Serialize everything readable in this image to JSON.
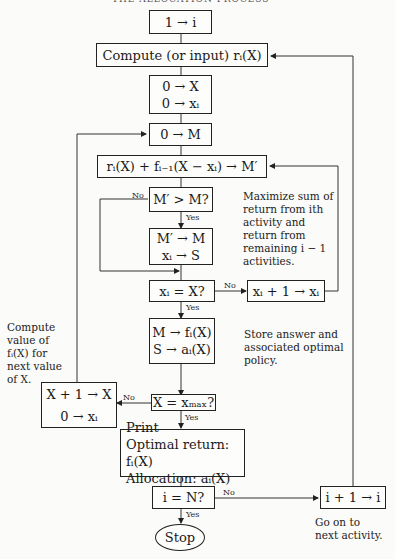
{
  "header": {
    "text": "THE ALLOCATION PROCESS"
  },
  "boxes": {
    "init_i": "1 → i",
    "compute_r": "Compute (or input) rᵢ(X)",
    "init_X": "0 → X",
    "init_xi": "0 → xᵢ",
    "init_M": "0 → M",
    "eval": "rᵢ(X) + fᵢ₋₁(X − xᵢ) → M′",
    "compare": "M′ > M?",
    "update_M": "M′ → M",
    "update_S": "xᵢ → S",
    "check_xi": "xᵢ = X?",
    "inc_xi": "xᵢ + 1 → xᵢ",
    "store_f": "M → fᵢ(X)",
    "store_a": "S → aᵢ(X)",
    "inc_X": "X + 1 → X",
    "reset_xi": "0 → xᵢ",
    "check_X": "X = xₘₐₓ?",
    "print_title": "Print",
    "print_return": "Optimal return: fᵢ(X)",
    "print_alloc": "Allocation: aᵢ(X)",
    "check_i": "i = N?",
    "inc_i": "i + 1 → i",
    "stop": "Stop"
  },
  "labels": {
    "yes": "Yes",
    "no": "No"
  },
  "notes": {
    "maximize": [
      "Maximize sum of",
      "return from ith",
      "activity and",
      "return from",
      "remaining i − 1",
      "activities."
    ],
    "store": [
      "Store answer and",
      "associated optimal",
      "policy."
    ],
    "compute_next": [
      "Compute",
      "value of",
      "fᵢ(X) for",
      "next value",
      "of X."
    ],
    "next_activity": [
      "Go on to",
      "next activity."
    ]
  }
}
